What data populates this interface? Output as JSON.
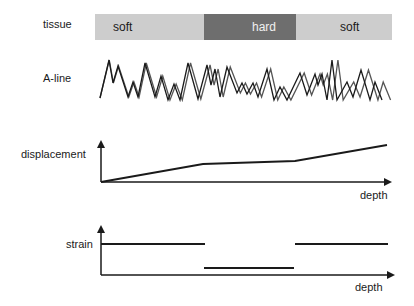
{
  "labels": {
    "tissue": "tissue",
    "aline": "A-line",
    "displacement": "displacement",
    "strain": "strain",
    "depth_top": "depth",
    "depth_bottom": "depth"
  },
  "tissue": {
    "segments": [
      {
        "label": "soft",
        "x0": 95,
        "x1": 204,
        "color": "#cdcdcd",
        "text_color": "#1a1a1a"
      },
      {
        "label": "hard",
        "x0": 204,
        "x1": 296,
        "color": "#6e6e6e",
        "text_color": "#f0f0f0"
      },
      {
        "label": "soft",
        "x0": 296,
        "x1": 392,
        "color": "#cdcdcd",
        "text_color": "#1a1a1a"
      }
    ]
  },
  "colors": {
    "line": "#1a1a1a",
    "line2": "#555555"
  },
  "aline": {
    "points": [
      [
        100,
        98
      ],
      [
        109,
        60
      ],
      [
        113,
        83
      ],
      [
        118,
        66
      ],
      [
        128,
        97
      ],
      [
        133,
        82
      ],
      [
        138,
        97
      ],
      [
        145,
        63
      ],
      [
        155,
        97
      ],
      [
        161,
        76
      ],
      [
        168,
        100
      ],
      [
        174,
        84
      ],
      [
        180,
        100
      ],
      [
        188,
        63
      ],
      [
        198,
        99
      ],
      [
        207,
        65
      ],
      [
        211,
        85
      ],
      [
        215,
        69
      ],
      [
        220,
        97
      ],
      [
        227,
        67
      ],
      [
        237,
        93
      ],
      [
        242,
        83
      ],
      [
        247,
        94
      ],
      [
        253,
        83
      ],
      [
        258,
        97
      ],
      [
        267,
        69
      ],
      [
        274,
        100
      ],
      [
        280,
        87
      ],
      [
        287,
        100
      ],
      [
        300,
        73
      ],
      [
        307,
        95
      ],
      [
        315,
        74
      ],
      [
        318,
        85
      ],
      [
        322,
        74
      ],
      [
        327,
        100
      ],
      [
        332,
        60
      ],
      [
        337,
        100
      ],
      [
        347,
        82
      ],
      [
        353,
        97
      ],
      [
        361,
        70
      ],
      [
        370,
        100
      ],
      [
        375,
        82
      ],
      [
        382,
        100
      ]
    ],
    "shift_curve": [
      [
        100,
        0
      ],
      [
        204,
        3
      ],
      [
        296,
        4
      ],
      [
        390,
        9
      ]
    ]
  },
  "chart_data": [
    {
      "type": "line",
      "title": "displacement",
      "xlabel": "depth",
      "ylabel": "displacement",
      "series": [
        {
          "name": "displacement",
          "x": [
            0,
            0.37,
            0.68,
            1.0
          ],
          "y": [
            0,
            0.42,
            0.47,
            0.85
          ]
        }
      ],
      "axis": {
        "x0": 101,
        "y0": 182,
        "xtip": 393,
        "ytip": 139,
        "xpx": [
          101,
          203,
          295,
          387
        ],
        "ypx": [
          182,
          164,
          161,
          145
        ]
      }
    },
    {
      "type": "line",
      "title": "strain",
      "xlabel": "depth",
      "ylabel": "strain",
      "series": [
        {
          "name": "strain",
          "segments": [
            {
              "x": [
                0,
                0.37
              ],
              "y": 0.62
            },
            {
              "x": [
                0.37,
                0.68
              ],
              "y": 0.14
            },
            {
              "x": [
                0.68,
                1.0
              ],
              "y": 0.62
            }
          ]
        }
      ],
      "axis": {
        "x0": 101,
        "y0": 275,
        "xtip": 396,
        "ytip": 224
      },
      "segments_px": [
        [
          101,
          244,
          205,
          244
        ],
        [
          204,
          268,
          294,
          268
        ],
        [
          295,
          244,
          388,
          244
        ]
      ]
    }
  ]
}
